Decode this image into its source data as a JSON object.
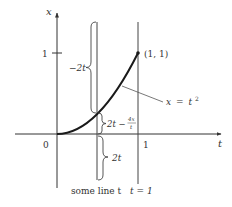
{
  "diagram": {
    "axes": {
      "vertical_label": "x",
      "horizontal_label": "t",
      "origin_label": "0",
      "x_tick_label": "1",
      "t_tick_label": "1"
    },
    "curve": {
      "equation_lhs": "x",
      "equation_eq": "=",
      "equation_rhs": "t",
      "equation_exp": "2",
      "endpoint_label": "(1, 1)"
    },
    "vertical_lines": [
      {
        "label": "some line t"
      },
      {
        "label": "t = 1"
      }
    ],
    "braces": [
      {
        "label": "−2t",
        "position": "upper-left"
      },
      {
        "label_main": "2t −",
        "label_num": "4x",
        "label_den": "t",
        "position": "middle-right"
      },
      {
        "label": "2t",
        "position": "lower-right"
      }
    ],
    "colors": {
      "axis": "#333333",
      "curve": "#1a1a1a",
      "line": "#444444",
      "text": "#333333"
    }
  }
}
